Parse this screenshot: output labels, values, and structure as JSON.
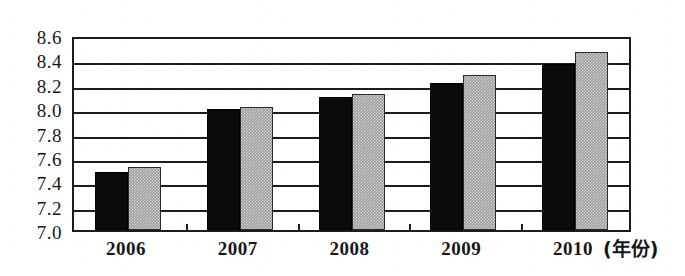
{
  "chart_data": {
    "type": "bar",
    "title": "",
    "subtitle": "",
    "xlabel": "年份",
    "xlabel_display": "(年份)",
    "ylabel": "",
    "categories": [
      "2006",
      "2007",
      "2008",
      "2009",
      "2010"
    ],
    "series": [
      {
        "name": "series-1",
        "color": "#0b0b0b",
        "pattern": "solid-black",
        "values": [
          7.48,
          7.99,
          8.09,
          8.21,
          8.36
        ]
      },
      {
        "name": "series-2",
        "color": "#9b9b9b",
        "pattern": "gray-dither",
        "values": [
          7.52,
          8.01,
          8.12,
          8.27,
          8.46
        ]
      }
    ],
    "ylim": [
      7.0,
      8.6
    ],
    "ytick_step": 0.2,
    "ytick_labels": [
      "8.6",
      "8.4",
      "8.2",
      "8.0",
      "7.8",
      "7.6",
      "7.4",
      "7.2",
      "7.0"
    ],
    "ytick_values": [
      8.6,
      8.4,
      8.2,
      8.0,
      7.8,
      7.6,
      7.4,
      7.2,
      7.0
    ],
    "grid": true,
    "grid_axis": "y",
    "legend": false,
    "legend_position": "none",
    "annotations": [],
    "axis_color": "#1c1c1e",
    "background": "#ffffff"
  }
}
